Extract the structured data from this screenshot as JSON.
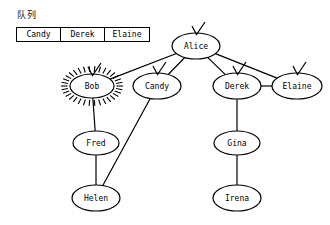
{
  "queue": {
    "label": "队列",
    "items": [
      "Candy",
      "Derek",
      "Elaine"
    ]
  },
  "graph": {
    "title": "",
    "nodes": [
      {
        "id": "alice",
        "label": "Alice",
        "x": 196,
        "y": 46,
        "rx": 24,
        "ry": 13,
        "checked": true,
        "highlighted": false
      },
      {
        "id": "bob",
        "label": "Bob",
        "x": 92,
        "y": 86,
        "rx": 22,
        "ry": 12,
        "checked": true,
        "highlighted": true
      },
      {
        "id": "candy",
        "label": "Candy",
        "x": 157,
        "y": 86,
        "rx": 24,
        "ry": 13,
        "checked": true,
        "highlighted": false
      },
      {
        "id": "derek",
        "label": "Derek",
        "x": 237,
        "y": 86,
        "rx": 24,
        "ry": 13,
        "checked": true,
        "highlighted": false
      },
      {
        "id": "elaine",
        "label": "Elaine",
        "x": 297,
        "y": 86,
        "rx": 25,
        "ry": 13,
        "checked": true,
        "highlighted": false
      },
      {
        "id": "fred",
        "label": "Fred",
        "x": 96,
        "y": 143,
        "rx": 23,
        "ry": 12,
        "checked": false,
        "highlighted": false
      },
      {
        "id": "gina",
        "label": "Gina",
        "x": 237,
        "y": 143,
        "rx": 23,
        "ry": 12,
        "checked": false,
        "highlighted": false
      },
      {
        "id": "helen",
        "label": "Helen",
        "x": 96,
        "y": 198,
        "rx": 24,
        "ry": 13,
        "checked": false,
        "highlighted": false
      },
      {
        "id": "irena",
        "label": "Irena",
        "x": 237,
        "y": 198,
        "rx": 24,
        "ry": 13,
        "checked": false,
        "highlighted": false
      }
    ],
    "edges": [
      {
        "from": "alice",
        "to": "bob"
      },
      {
        "from": "alice",
        "to": "candy"
      },
      {
        "from": "alice",
        "to": "derek"
      },
      {
        "from": "alice",
        "to": "elaine"
      },
      {
        "from": "derek",
        "to": "elaine"
      },
      {
        "from": "bob",
        "to": "fred"
      },
      {
        "from": "fred",
        "to": "helen"
      },
      {
        "from": "candy",
        "to": "helen"
      },
      {
        "from": "derek",
        "to": "gina"
      },
      {
        "from": "gina",
        "to": "irena"
      }
    ],
    "colors": {
      "stroke": "#000000",
      "node_fill": "#ffffff",
      "background": "#ffffff"
    }
  }
}
